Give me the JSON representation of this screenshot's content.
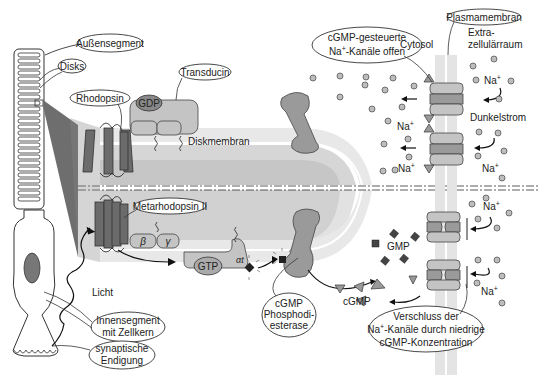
{
  "labels": {
    "outer_segment": "Außensegment",
    "disks": "Disks",
    "rhodopsin": "Rhodopsin",
    "transducin": "Transducin",
    "gdp": "GDP",
    "disk_membrane": "Diskmembran",
    "metarhodopsin": "Metarhodopsin II",
    "beta": "β",
    "gamma": "γ",
    "gtp": "GTP",
    "alpha_t": "αt",
    "light": "Licht",
    "inner_segment_line1": "Innensegment",
    "inner_segment_line2": "mit Zellkern",
    "synaptic_line1": "synaptische",
    "synaptic_line2": "Endigung",
    "pde_line1": "cGMP",
    "pde_line2": "Phosphodi-",
    "pde_line3": "esterase",
    "cgmp": "cGMP",
    "gmp": "GMP",
    "channels_open_line1": "cGMP-gesteuerte",
    "channels_open_line2_pre": "Na",
    "channels_open_line2_sup": "+",
    "channels_open_line2_post": "-Kanäle offen",
    "plasma_membrane": "Plasmamembran",
    "cytosol": "Cytosol",
    "extracellular_line1": "Extra-",
    "extracellular_line2": "zellulärraum",
    "dark_current": "Dunkelstrom",
    "na": "Na",
    "na_sup": "+",
    "closure_line1": "Verschluss der",
    "closure_line2_pre": "Na",
    "closure_line2_sup": "+",
    "closure_line2_post": "-Kanäle durch niedrige",
    "closure_line3": "cGMP-Konzentration"
  },
  "colors": {
    "membrane_light": "#e6e6e6",
    "membrane_mid": "#cfcfcf",
    "protein_dark": "#6b6b6b",
    "protein_mid": "#9a9a9a",
    "ion": "#bdbdbd"
  }
}
